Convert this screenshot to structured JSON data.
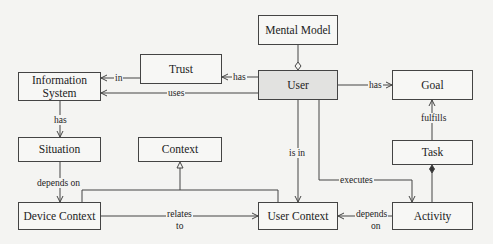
{
  "nodes": {
    "mental_model": "Mental Model",
    "trust": "Trust",
    "user": "User",
    "goal": "Goal",
    "information_system": "Information System",
    "situation": "Situation",
    "context": "Context",
    "task": "Task",
    "device_context": "Device Context",
    "user_context": "User Context",
    "activity": "Activity"
  },
  "edges": {
    "trust_in_is": "in",
    "user_has_trust": "has",
    "user_uses_is": "uses",
    "user_has_goal": "has",
    "task_fulfills_goal": "fulfills",
    "is_has_situation": "has",
    "situation_depends_on": "depends on",
    "user_is_in": "is in",
    "user_executes": "executes",
    "relates_to_1": "relates",
    "relates_to_2": "to",
    "depends_on_1": "depends",
    "depends_on_2": "on"
  }
}
